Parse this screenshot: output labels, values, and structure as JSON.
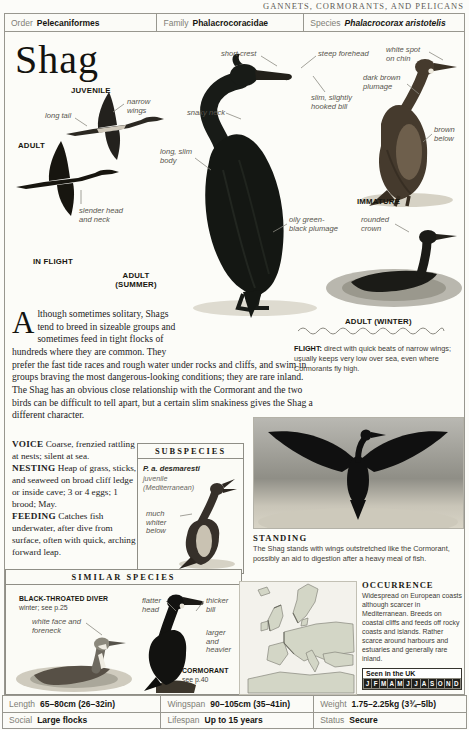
{
  "page_header": "GANNETS, CORMORANTS, AND PELICANS",
  "classification": {
    "order_label": "Order",
    "order_value": "Pelecaniformes",
    "family_label": "Family",
    "family_value": "Phalacrocoracidae",
    "species_label": "Species",
    "species_value": "Phalacrocorax aristotelis"
  },
  "title": "Shag",
  "annotations": {
    "juvenile": "JUVENILE",
    "narrow_wings": "narrow wings",
    "long_tail": "long tail",
    "adult": "ADULT",
    "slender_head": "slender head and neck",
    "in_flight": "IN FLIGHT",
    "adult_summer": "ADULT (SUMMER)",
    "short_crest": "short crest",
    "snaky_neck": "snaky neck",
    "long_slim_body": "long, slim body",
    "steep_forehead": "steep forehead",
    "hooked_bill": "slim, slightly hooked bill",
    "white_spot": "white spot on chin",
    "dark_brown_plumage": "dark brown plumage",
    "brown_below": "brown below",
    "immature": "IMMATURE",
    "oily_plumage": "oily green-black plumage",
    "rounded_crown": "rounded crown",
    "adult_winter": "ADULT (WINTER)"
  },
  "intro": {
    "dropcap": "A",
    "text": "lthough sometimes solitary, Shags tend to breed in sizeable groups and sometimes feed in tight flocks of hundreds where they are common. They prefer the fast tide races and rough water under rocks and cliffs, and swim in groups braving the most dangerous-looking conditions; they are rare inland. The Shag has an obvious close relationship with the Cormorant and the two birds can be difficult to tell apart, but a certain slim snakiness gives the Shag a different character."
  },
  "facts": [
    {
      "label": "VOICE",
      "text": "Coarse, frenzied rattling at nests; silent at sea."
    },
    {
      "label": "NESTING",
      "text": "Heap of grass, sticks, and seaweed on broad cliff ledge or inside cave; 3 or 4 eggs; 1 brood; May."
    },
    {
      "label": "FEEDING",
      "text": "Catches fish underwater, after dive from surface, often with quick, arching forward leap."
    }
  ],
  "subspecies": {
    "header": "SUBSPECIES",
    "name": "P. a. desmaresti",
    "detail": "juvenile (Mediterranean)",
    "annotation": "much whiter below"
  },
  "flight": {
    "label": "FLIGHT:",
    "text": "direct with quick beats of narrow wings; usually keeps very low over sea, even where Cormorants fly high."
  },
  "standing": {
    "label": "STANDING",
    "text": "The Shag stands with wings outstretched like the Cormorant, possibly an aid to digestion after a heavy meal of fish."
  },
  "similar_species": {
    "header": "SIMILAR SPECIES",
    "bird1_name": "BLACK-THROATED DIVER",
    "bird1_ref": "winter; see p.25",
    "bird1_note": "white face and foreneck",
    "bird2_notes": [
      "flatter head",
      "thicker bill",
      "larger and heavier"
    ],
    "bird2_name": "CORMORANT",
    "bird2_ref": "see p.40"
  },
  "occurrence": {
    "header": "OCCURRENCE",
    "text": "Widespread on European coasts although scarcer in Mediterranean. Breeds on coastal cliffs and feeds off rocky coasts and islands. Rather scarce around harbours and estuaries and generally rare inland.",
    "seen_label": "Seen in the UK",
    "months": [
      "J",
      "F",
      "M",
      "A",
      "M",
      "J",
      "J",
      "A",
      "S",
      "O",
      "N",
      "D"
    ]
  },
  "stats": {
    "rows": [
      [
        {
          "label": "Length",
          "value": "65–80cm (26–32in)"
        },
        {
          "label": "Wingspan",
          "value": "90–105cm (35–41in)"
        },
        {
          "label": "Weight",
          "value": "1.75–2.25kg (3¾–5lb)"
        }
      ],
      [
        {
          "label": "Social",
          "value": "Large flocks"
        },
        {
          "label": "Lifespan",
          "value": "Up to 15 years"
        },
        {
          "label": "Status",
          "value": "Secure"
        }
      ]
    ]
  }
}
